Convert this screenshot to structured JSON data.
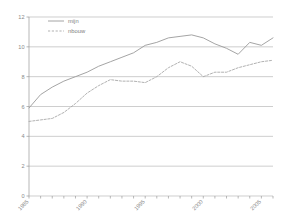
{
  "chart_data": {
    "type": "line",
    "title": "",
    "subtitle": "",
    "xlabel": "",
    "ylabel": "",
    "xlim": [
      1985,
      2006
    ],
    "ylim": [
      0,
      12
    ],
    "grid": true,
    "grid_axis": "y",
    "legend_position": "top-left-inside",
    "y_ticks": [
      0,
      2,
      4,
      6,
      8,
      10,
      12
    ],
    "y_tick_labels": [
      "0",
      "2",
      "4",
      "6",
      "8",
      "10",
      "12"
    ],
    "x_ticks": [
      1985,
      1986,
      1987,
      1988,
      1989,
      1990,
      1991,
      1992,
      1993,
      1994,
      1995,
      1996,
      1997,
      1998,
      1999,
      2000,
      2001,
      2002,
      2003,
      2004,
      2005,
      2006
    ],
    "x_tick_labels": [
      "1985",
      "",
      "",
      "",
      "",
      "1990",
      "",
      "",
      "",
      "",
      "1995",
      "",
      "",
      "",
      "",
      "2000",
      "",
      "",
      "",
      "",
      "2005",
      ""
    ],
    "x_tick_label_rotation": -45,
    "x": [
      1985,
      1986,
      1987,
      1988,
      1989,
      1990,
      1991,
      1992,
      1993,
      1994,
      1995,
      1996,
      1997,
      1998,
      1999,
      2000,
      2001,
      2002,
      2003,
      2004,
      2005,
      2006
    ],
    "series": [
      {
        "name": "mijn",
        "style": "solid",
        "color": "#9a9a9a",
        "values": [
          5.9,
          6.8,
          7.3,
          7.7,
          8.0,
          8.3,
          8.7,
          9.0,
          9.3,
          9.6,
          10.1,
          10.3,
          10.6,
          10.7,
          10.8,
          10.6,
          10.2,
          9.9,
          9.5,
          10.3,
          10.1,
          10.6
        ]
      },
      {
        "name": "nbouw",
        "style": "dashed",
        "color": "#a8a8a8",
        "values": [
          5.0,
          5.1,
          5.2,
          5.6,
          6.2,
          6.9,
          7.4,
          7.8,
          7.7,
          7.7,
          7.6,
          8.0,
          8.6,
          9.0,
          8.7,
          8.0,
          8.3,
          8.3,
          8.6,
          8.8,
          9.0,
          9.1
        ]
      }
    ]
  },
  "legend": {
    "entries": [
      {
        "label": "mijn"
      },
      {
        "label": "nbouw"
      }
    ]
  },
  "colors": {
    "grid": "#b9b9b9",
    "axis": "#9a9a9a",
    "tick_label": "#8a8a8a",
    "series_solid": "#9a9a9a",
    "series_dashed": "#a8a8a8",
    "background": "#ffffff"
  }
}
